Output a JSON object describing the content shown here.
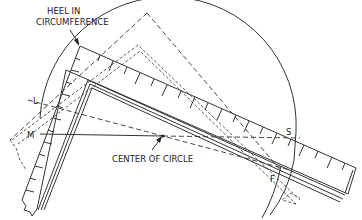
{
  "figure": {
    "colors": {
      "ink": "#333333",
      "background": "#ffffff"
    }
  },
  "labels": {
    "heel": {
      "line1": "HEEL IN",
      "line2": "CIRCUMFERENCE"
    },
    "center": "CENTER OF CIRCLE",
    "point_l": "L",
    "point_m": "M",
    "point_s": "S",
    "point_f": "F"
  },
  "elements": [
    {
      "name": "circle-arc",
      "type": "arc"
    },
    {
      "name": "framing-square-upper",
      "type": "square",
      "style": "solid",
      "heel": "in circumference"
    },
    {
      "name": "framing-square-inner",
      "type": "square",
      "style": "solid double-line"
    },
    {
      "name": "framing-square-dashed",
      "type": "square",
      "style": "dashed"
    },
    {
      "name": "diameter-line-ms",
      "type": "line",
      "from": "M",
      "to": "S"
    },
    {
      "name": "chord-line-lf",
      "type": "line",
      "from": "L",
      "to": "F"
    }
  ]
}
